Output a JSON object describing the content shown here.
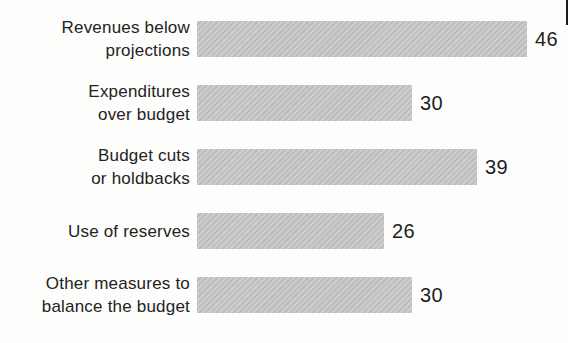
{
  "chart_data": {
    "type": "bar",
    "orientation": "horizontal",
    "title": "",
    "xlabel": "",
    "ylabel": "",
    "grid": false,
    "legend": false,
    "axis_shown": false,
    "xlim": [
      0,
      46
    ],
    "categories": [
      "Revenues below projections",
      "Expenditures over budget",
      "Budget cuts or holdbacks",
      "Use of reserves",
      "Other measures to balance the budget"
    ],
    "category_lines": [
      [
        "Revenues below",
        "projections"
      ],
      [
        "Expenditures",
        "over budget"
      ],
      [
        "Budget cuts",
        "or holdbacks"
      ],
      [
        "Use of reserves"
      ],
      [
        "Other measures to",
        "balance the budget"
      ]
    ],
    "values": [
      46,
      30,
      39,
      26,
      30
    ],
    "value_labels": [
      "46",
      "30",
      "39",
      "26",
      "30"
    ],
    "bar_color": "#c5c5c5",
    "label_color": "#232323",
    "value_color": "#1e1e1e"
  },
  "artifacts": {
    "edge_mark_color": "#1c1c1c"
  }
}
